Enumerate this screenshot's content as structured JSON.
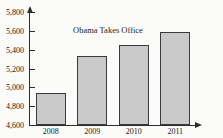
{
  "chart_data": {
    "type": "bar",
    "title": "U.S. Annual Production of Oil",
    "xlabel": "",
    "ylabel": "",
    "categories": [
      "2008",
      "2009",
      "2010",
      "2011"
    ],
    "values": [
      4940,
      5330,
      5450,
      5590
    ],
    "ylim": [
      4600,
      5800
    ],
    "ytick_values": [
      4600,
      4800,
      5000,
      5200,
      5400,
      5600,
      5800
    ],
    "ytick_labels": [
      "4,600",
      "4,800",
      "5,000",
      "5,200",
      "5,400",
      "5,600",
      "5,800"
    ],
    "grid": false,
    "legend": null,
    "annotations": [
      {
        "text": "Obama Takes Office",
        "x": "2009",
        "y": 5700
      }
    ],
    "series": [
      {
        "name": "Annual Production",
        "values": [
          4940,
          5330,
          5450,
          5590
        ]
      }
    ],
    "colors": {
      "bar_fill": "#c9c9c9",
      "bar_border": "#3a3a3a",
      "axis": "#2e2e2e",
      "text": "#1a1a1a",
      "background": "#fbfbfa"
    }
  }
}
